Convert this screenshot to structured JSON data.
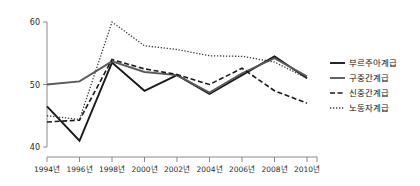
{
  "chart_data": {
    "type": "line",
    "title": "",
    "xlabel": "",
    "ylabel": "",
    "grid": false,
    "legend_position": "right",
    "categories": [
      "1994년",
      "1996년",
      "1998년",
      "2000년",
      "2002년",
      "2004년",
      "2006년",
      "2008년",
      "2010년"
    ],
    "x_tick_labels": [
      "1994년",
      "1996년",
      "1998년",
      "2000년",
      "2002년",
      "2004년",
      "2006년",
      "2008년",
      "2010년"
    ],
    "y_tick_labels": [
      "40",
      "50",
      "60"
    ],
    "y_ticks": [
      40,
      50,
      60
    ],
    "ylim": [
      40,
      60
    ],
    "xlim": [
      1994,
      2010
    ],
    "series": [
      {
        "name": "부르주아계급",
        "style": "solid-dark",
        "color": "#1a1a1a",
        "values": [
          46.5,
          41.0,
          53.5,
          49.0,
          51.5,
          48.5,
          51.5,
          54.5,
          51.0
        ]
      },
      {
        "name": "구중간계급",
        "style": "solid-gray",
        "color": "#555555",
        "values": [
          50.0,
          50.5,
          53.7,
          52.0,
          51.5,
          48.7,
          51.8,
          54.2,
          51.3
        ]
      },
      {
        "name": "신중간계급",
        "style": "dashed",
        "color": "#1a1a1a",
        "values": [
          44.0,
          44.3,
          54.0,
          52.5,
          51.6,
          50.0,
          52.6,
          49.0,
          47.0
        ]
      },
      {
        "name": "노동자계급",
        "style": "dotted",
        "color": "#333333",
        "values": [
          45.0,
          44.4,
          60.0,
          56.2,
          55.6,
          54.6,
          54.5,
          53.6,
          51.0
        ]
      }
    ]
  },
  "legend": {
    "items": [
      {
        "label": "부르주아계급",
        "style": "solid-dark"
      },
      {
        "label": "구중간계급",
        "style": "solid-gray"
      },
      {
        "label": "신중간계급",
        "style": "dashed"
      },
      {
        "label": "노동자계급",
        "style": "dotted"
      }
    ]
  },
  "colors": {
    "axis": "#8a8a8a",
    "text": "#2b2b2b",
    "background": "#ffffff"
  }
}
